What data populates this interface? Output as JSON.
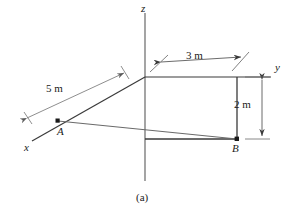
{
  "figure": {
    "caption": "(a)",
    "type": "3d-coordinate-axes-diagram",
    "axes": [
      {
        "name": "x",
        "label": "x",
        "label_x": 26,
        "label_y": 146
      },
      {
        "name": "y",
        "label": "y",
        "label_x": 276,
        "label_y": 68
      },
      {
        "name": "z",
        "label": "z",
        "label_x": 141,
        "label_y": 4
      }
    ],
    "points": [
      {
        "name": "A",
        "label": "A",
        "label_x": 59,
        "label_y": 133,
        "px": 58,
        "py": 121
      },
      {
        "name": "B",
        "label": "B",
        "label_x": 232,
        "label_y": 145,
        "px": 237,
        "py": 139
      }
    ],
    "dimensions": [
      {
        "name": "5m",
        "label": "5 m",
        "label_x": 54,
        "label_y": 89,
        "value": 5,
        "unit": "m",
        "along": "x-axis",
        "from": "origin",
        "to": "A"
      },
      {
        "name": "3m",
        "label": "3 m",
        "label_x": 192,
        "label_y": 56,
        "value": 3,
        "unit": "m",
        "along": "y-axis",
        "from": "origin",
        "to": "corner"
      },
      {
        "name": "2m",
        "label": "2 m",
        "label_x": 239,
        "label_y": 100,
        "value": 2,
        "unit": "m",
        "along": "z-axis",
        "from": "corner",
        "to": "B"
      }
    ],
    "colors": {
      "stroke": "#2a2a2a",
      "light_stroke": "#8a8a8a",
      "text": "#1a1a1a",
      "background": "#ffffff"
    }
  }
}
